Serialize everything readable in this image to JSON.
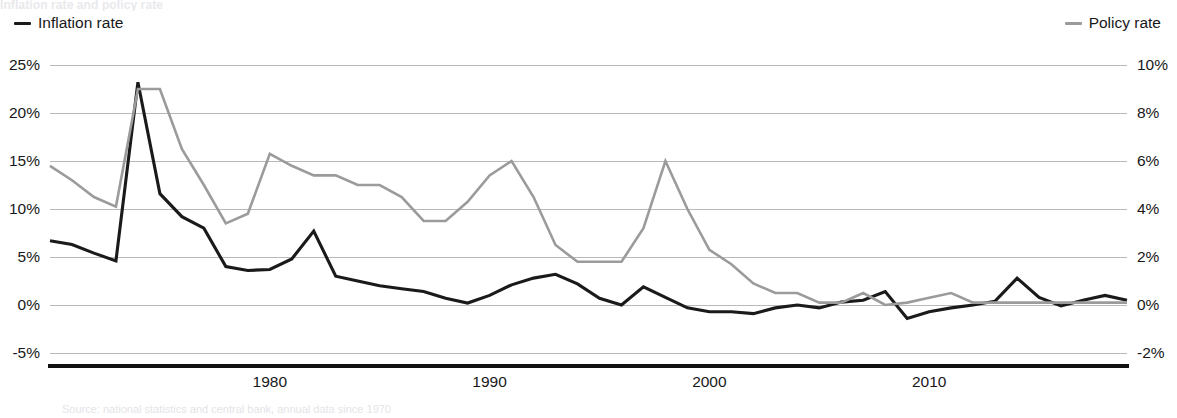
{
  "figure": {
    "top_cropped_caption": "Inflation rate and policy rate",
    "bottom_cropped_caption": "Source: national statistics and central bank, annual data since 1970"
  },
  "legend": {
    "position": "top",
    "inflation": {
      "label": "Inflation rate",
      "color": "#1a1a1a",
      "axis": "left"
    },
    "policy": {
      "label": "Policy rate",
      "color": "#9b9b9b",
      "axis": "right"
    }
  },
  "axes": {
    "left": {
      "ticks": [
        "25%",
        "20%",
        "15%",
        "10%",
        "5%",
        "0%",
        "-5%"
      ],
      "values": [
        25,
        20,
        15,
        10,
        5,
        0,
        -5
      ],
      "min": -5,
      "max": 25
    },
    "right": {
      "ticks": [
        "10%",
        "8%",
        "6%",
        "4%",
        "2%",
        "0%",
        "-2%"
      ],
      "values": [
        10,
        8,
        6,
        4,
        2,
        0,
        -2
      ],
      "min": -2,
      "max": 10
    },
    "x": {
      "ticks": [
        "1980",
        "1990",
        "2000",
        "2010"
      ],
      "values": [
        1980,
        1990,
        2000,
        2010
      ],
      "min": 1970,
      "max": 2019
    }
  },
  "chart_data": {
    "type": "line",
    "title": "Inflation rate and policy rate",
    "xlabel": "",
    "ylabel": "Inflation rate",
    "y2label": "Policy rate",
    "grid": true,
    "legend_position": "top",
    "ylim": [
      -5,
      25
    ],
    "y2lim": [
      -2,
      10
    ],
    "xlim": [
      1970,
      2019
    ],
    "x": [
      1970,
      1971,
      1972,
      1973,
      1974,
      1975,
      1976,
      1977,
      1978,
      1979,
      1980,
      1981,
      1982,
      1983,
      1984,
      1985,
      1986,
      1987,
      1988,
      1989,
      1990,
      1991,
      1992,
      1993,
      1994,
      1995,
      1996,
      1997,
      1998,
      1999,
      2000,
      2001,
      2002,
      2003,
      2004,
      2005,
      2006,
      2007,
      2008,
      2009,
      2010,
      2011,
      2012,
      2013,
      2014,
      2015,
      2016,
      2017,
      2018,
      2019
    ],
    "series": [
      {
        "name": "Inflation rate",
        "axis": "left",
        "unit": "%",
        "color": "#1a1a1a",
        "values": [
          6.7,
          6.3,
          5.4,
          4.6,
          23.2,
          11.6,
          9.2,
          8.0,
          4.0,
          3.6,
          3.7,
          4.8,
          7.7,
          3.0,
          2.5,
          2.0,
          1.7,
          1.4,
          0.7,
          0.2,
          1.0,
          2.1,
          2.8,
          3.2,
          2.2,
          0.7,
          0.0,
          1.9,
          0.8,
          -0.3,
          -0.7,
          -0.7,
          -0.9,
          -0.3,
          0.0,
          -0.3,
          0.3,
          0.5,
          1.4,
          -1.4,
          -0.7,
          -0.3,
          0.0,
          0.4,
          2.8,
          0.8,
          -0.1,
          0.5,
          1.0,
          0.5
        ]
      },
      {
        "name": "Policy rate",
        "axis": "right",
        "unit": "%",
        "color": "#9b9b9b",
        "values": [
          5.8,
          5.2,
          4.5,
          4.1,
          9.0,
          9.0,
          6.5,
          5.0,
          3.4,
          3.8,
          6.3,
          5.8,
          5.4,
          5.4,
          5.0,
          5.0,
          4.5,
          3.5,
          3.5,
          4.3,
          5.4,
          6.0,
          4.5,
          2.5,
          1.8,
          1.8,
          1.8,
          3.2,
          6.0,
          4.0,
          2.3,
          1.7,
          0.9,
          0.5,
          0.5,
          0.1,
          0.1,
          0.5,
          0.0,
          0.1,
          0.3,
          0.5,
          0.1,
          0.1,
          0.1,
          0.1,
          0.1,
          0.1,
          0.1,
          0.1
        ]
      }
    ]
  }
}
